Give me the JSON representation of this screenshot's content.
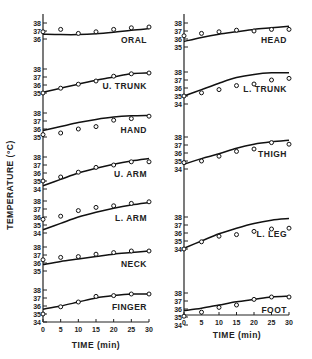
{
  "chart_data": {
    "type": "line",
    "title": "",
    "xlabel": "TIME (min)",
    "ylabel": "TEMPERATURE (°C)",
    "x_ticks": [
      0,
      5,
      10,
      15,
      20,
      25,
      30
    ],
    "xlim": [
      0,
      30
    ],
    "grid": false,
    "legend": "none",
    "note": "Solid line = model prediction; open circles = measured values",
    "x": [
      0,
      5,
      10,
      15,
      20,
      25,
      30
    ],
    "panels": [
      {
        "name": "ORAL",
        "column": "left",
        "yticks": [
          36,
          37,
          38
        ],
        "ylim": [
          36,
          38
        ],
        "line": [
          36.6,
          36.55,
          36.55,
          36.65,
          36.85,
          37.1,
          37.3
        ],
        "points": [
          36.9,
          37.2,
          36.7,
          36.9,
          37.2,
          37.4,
          37.5
        ]
      },
      {
        "name": "U. TRUNK",
        "column": "left",
        "yticks": [
          35,
          36,
          37,
          38
        ],
        "ylim": [
          35,
          38
        ],
        "line": [
          35.1,
          35.6,
          36.1,
          36.6,
          37.0,
          37.4,
          37.5
        ],
        "points": [
          35.0,
          35.6,
          36.1,
          36.5,
          37.1,
          37.4,
          37.5
        ]
      },
      {
        "name": "HAND",
        "column": "left",
        "yticks": [
          35,
          36,
          37,
          38
        ],
        "ylim": [
          35,
          38
        ],
        "line": [
          35.8,
          36.3,
          36.8,
          37.2,
          37.5,
          37.65,
          37.7
        ],
        "points": [
          35.3,
          35.5,
          36.0,
          36.3,
          37.1,
          37.3,
          37.6
        ]
      },
      {
        "name": "U. ARM",
        "column": "left",
        "yticks": [
          34,
          35,
          36,
          37,
          38
        ],
        "ylim": [
          34,
          38
        ],
        "line": [
          34.4,
          35.2,
          36.0,
          36.6,
          37.1,
          37.5,
          37.8
        ],
        "points": [
          35.0,
          35.5,
          36.1,
          36.7,
          37.0,
          37.4,
          37.4
        ]
      },
      {
        "name": "L. ARM",
        "column": "left",
        "yticks": [
          34,
          35,
          36,
          37,
          38
        ],
        "ylim": [
          34,
          38
        ],
        "line": [
          34.4,
          35.2,
          36.0,
          36.6,
          37.1,
          37.5,
          37.8
        ],
        "points": [
          35.7,
          36.1,
          36.8,
          37.2,
          37.4,
          37.7,
          37.9
        ]
      },
      {
        "name": "NECK",
        "column": "left",
        "yticks": [
          35,
          36,
          37,
          38
        ],
        "ylim": [
          35,
          38
        ],
        "line": [
          35.8,
          36.2,
          36.5,
          36.8,
          37.1,
          37.3,
          37.5
        ],
        "points": [
          36.4,
          36.7,
          36.8,
          37.1,
          37.3,
          37.5,
          37.5
        ]
      },
      {
        "name": "FINGER",
        "column": "left",
        "yticks": [
          34,
          35,
          36,
          37,
          38
        ],
        "ylim": [
          34,
          38
        ],
        "line": [
          35.6,
          36.0,
          36.5,
          37.0,
          37.3,
          37.5,
          37.5
        ],
        "points": [
          35.0,
          35.9,
          36.5,
          37.2,
          37.3,
          37.5,
          37.5
        ]
      },
      {
        "name": "HEAD",
        "column": "right",
        "yticks": [
          35,
          36,
          37,
          38
        ],
        "ylim": [
          35,
          38
        ],
        "line": [
          35.7,
          36.2,
          36.6,
          36.9,
          37.2,
          37.4,
          37.6
        ],
        "points": [
          36.4,
          36.7,
          36.9,
          37.1,
          37.0,
          37.2,
          37.2
        ]
      },
      {
        "name": "L. TRUNK",
        "column": "right",
        "yticks": [
          34,
          35,
          36,
          37,
          38
        ],
        "ylim": [
          34,
          38
        ],
        "line": [
          35.0,
          35.8,
          36.6,
          37.3,
          37.7,
          37.9,
          37.9
        ],
        "points": [
          35.0,
          35.4,
          35.8,
          36.3,
          36.5,
          37.0,
          37.2
        ]
      },
      {
        "name": "THIGH",
        "column": "right",
        "yticks": [
          34,
          35,
          36,
          37,
          38
        ],
        "ylim": [
          34,
          38
        ],
        "line": [
          34.6,
          35.3,
          35.9,
          36.6,
          37.1,
          37.4,
          37.6
        ],
        "points": [
          34.8,
          35.0,
          35.6,
          36.2,
          36.5,
          37.3,
          37.1
        ]
      },
      {
        "name": "L. LEG",
        "column": "right",
        "yticks": [
          34,
          35,
          36,
          37,
          38
        ],
        "ylim": [
          34,
          38
        ],
        "line": [
          34.1,
          35.0,
          35.9,
          36.6,
          37.2,
          37.6,
          37.8
        ],
        "points": [
          34.0,
          34.9,
          35.6,
          35.8,
          36.2,
          36.5,
          36.6
        ]
      },
      {
        "name": "FOOT",
        "column": "right",
        "yticks": [
          34,
          35,
          36,
          37,
          38
        ],
        "ylim": [
          34,
          38
        ],
        "line": [
          35.8,
          36.1,
          36.5,
          36.9,
          37.2,
          37.5,
          37.6
        ],
        "points": [
          35.1,
          35.6,
          36.2,
          36.5,
          37.2,
          37.5,
          37.5
        ]
      }
    ]
  },
  "labels": {
    "ylabel": "TEMPERATURE (°C)",
    "xlabel_left": "TIME (min)",
    "xlabel_right": "TIME (min)"
  }
}
